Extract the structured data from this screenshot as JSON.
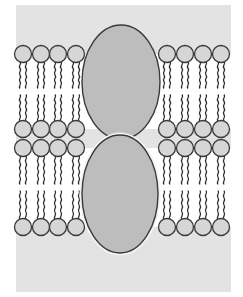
{
  "diagram": {
    "title": "",
    "colors": {
      "page_background": "#ffffff",
      "aqueous_region": "#e3e3e3",
      "head_fill": "#d6d6d6",
      "protein_fill": "#bdbdbd",
      "outline": "#3a3a3a",
      "tail": "#2e2e2e"
    },
    "regions": {
      "top_aqueous": {
        "x": 16,
        "y": 5,
        "w": 215,
        "h": 49
      },
      "middle_aqueous": {
        "x": 16,
        "y": 129,
        "w": 215,
        "h": 19
      },
      "bottom_aqueous": {
        "x": 16,
        "y": 227,
        "w": 215,
        "h": 65
      }
    },
    "bilayers": [
      {
        "name": "upper-bilayer",
        "top_head_y": 54,
        "bottom_head_y": 129
      },
      {
        "name": "lower-bilayer",
        "top_head_y": 148,
        "bottom_head_y": 227
      }
    ],
    "head_radius": 8.5,
    "left_head_x": [
      23,
      41,
      58,
      76
    ],
    "right_head_x": [
      167,
      185,
      203,
      221
    ],
    "proteins": [
      {
        "name": "upper-protein",
        "cx": 121,
        "cy": 82,
        "rx": 39,
        "ry": 57
      },
      {
        "name": "lower-protein",
        "cx": 120,
        "cy": 194,
        "rx": 38,
        "ry": 59
      }
    ],
    "labels": []
  }
}
